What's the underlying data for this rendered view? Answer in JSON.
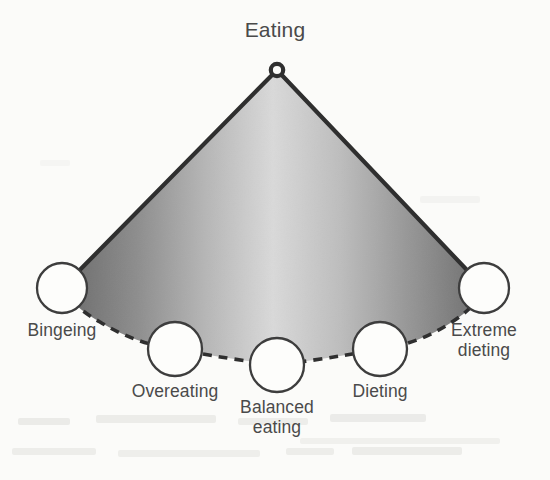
{
  "diagram": {
    "type": "continuum-fan-diagram",
    "title": "Eating",
    "apex_node_name": "eating-apex-node",
    "background_color": "#fbfbf9",
    "ink_color": "#3a3a3a",
    "label_color": "#4a4a4a",
    "fan_gradient": {
      "edge_color": "#6e6e6e",
      "center_color": "#d8d8d8"
    },
    "nodes": [
      {
        "id": "bingeing",
        "label": "Bingeing",
        "label_lines": [
          "Bingeing"
        ],
        "cx": 62,
        "cy": 288,
        "r": 25,
        "label_x": 62,
        "label_y": 320
      },
      {
        "id": "overeating",
        "label": "Overeating",
        "label_lines": [
          "Overeating"
        ],
        "cx": 175,
        "cy": 349,
        "r": 27,
        "label_x": 175,
        "label_y": 381
      },
      {
        "id": "balanced-eating",
        "label": "Balanced eating",
        "label_lines": [
          "Balanced",
          "eating"
        ],
        "cx": 277,
        "cy": 365,
        "r": 27,
        "label_x": 277,
        "label_y": 397
      },
      {
        "id": "dieting",
        "label": "Dieting",
        "label_lines": [
          "Dieting"
        ],
        "cx": 380,
        "cy": 349,
        "r": 27,
        "label_x": 380,
        "label_y": 381
      },
      {
        "id": "extreme-dieting",
        "label": "Extreme dieting",
        "label_lines": [
          "Extreme",
          "dieting"
        ],
        "cx": 484,
        "cy": 288,
        "r": 25,
        "label_x": 484,
        "label_y": 320
      }
    ],
    "apex": {
      "cx": 277,
      "cy": 70,
      "r": 6
    },
    "arc_style": "dashed",
    "edge_style": "solid"
  }
}
